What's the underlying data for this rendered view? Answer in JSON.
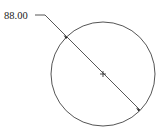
{
  "drawing": {
    "dimension": {
      "type": "diameter",
      "value_label": "88.00"
    },
    "circle": {
      "center": [
        103,
        74
      ],
      "radius": 52,
      "stroke_color": "#444444"
    },
    "center_mark": "cross"
  }
}
